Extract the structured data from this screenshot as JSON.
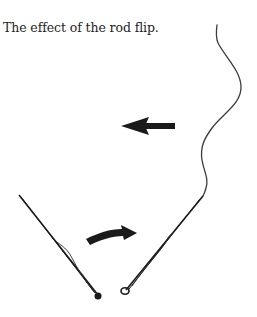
{
  "figure": {
    "caption": "The effect of the rod flip.",
    "elements": [
      {
        "name": "fly-line",
        "description": "wavy line trailing upward from right rod tip"
      },
      {
        "name": "left-arrow",
        "description": "straight arrow pointing left"
      },
      {
        "name": "curved-arrow",
        "description": "curved arrow pointing right, indicating rod flip"
      },
      {
        "name": "rod-before",
        "description": "rod leaning up-left, before flip"
      },
      {
        "name": "rod-after",
        "description": "rod leaning up-right, after flip"
      }
    ],
    "colors": {
      "ink": "#1a1a1a",
      "line": "#3a3a3a",
      "background": "#ffffff"
    }
  }
}
